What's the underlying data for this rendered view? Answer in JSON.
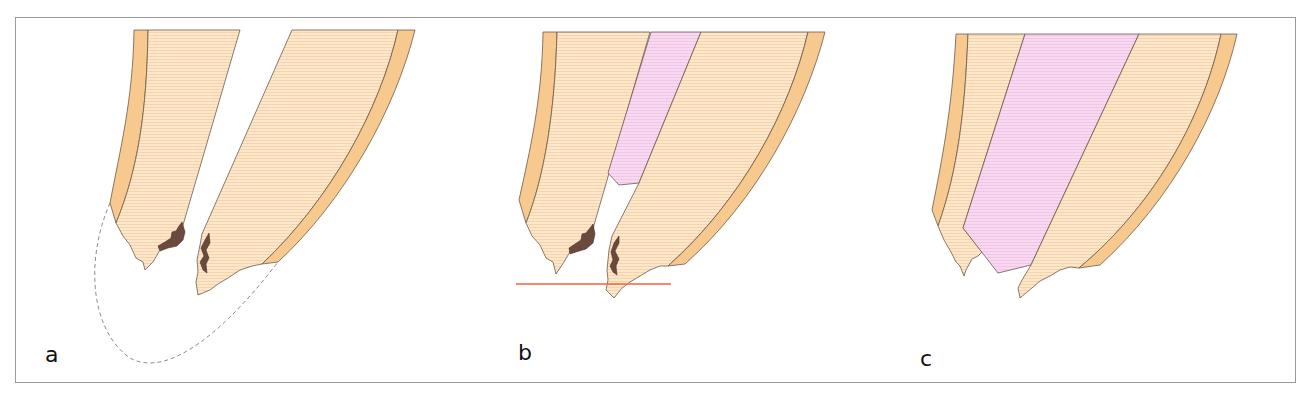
{
  "figure": {
    "panels": [
      {
        "id": "a",
        "label": "a",
        "description": "root apex with open canal, resorption/caries at apex, dashed outline of original root shape"
      },
      {
        "id": "b",
        "label": "b",
        "description": "partial canal filling (pink), red line marking resection level"
      },
      {
        "id": "c",
        "label": "c",
        "description": "canal fully filled (pink) to the apex"
      }
    ],
    "colors": {
      "dentin": "#fbe3c4",
      "cementum": "#f8c98f",
      "filling": "#f7d3ef",
      "caries": "#6b4a3e",
      "resection_line": "#f0643c",
      "dashed_outline": "#8c8c8c",
      "frame": "#9a9a9a"
    }
  }
}
